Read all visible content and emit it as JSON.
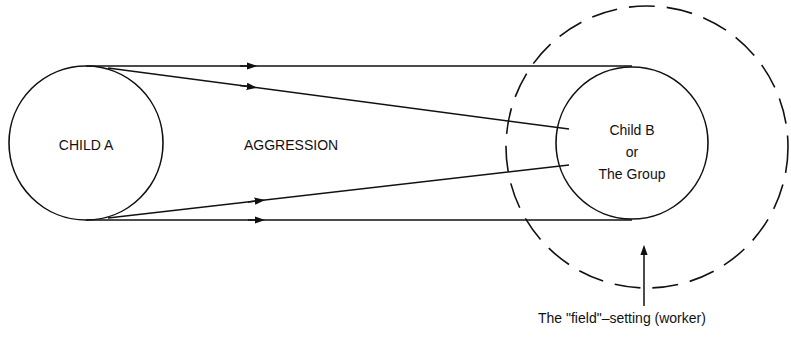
{
  "diagram": {
    "title": "",
    "nodes": {
      "child_a": {
        "label": "CHILD A"
      },
      "child_b": {
        "line1": "Child B",
        "line2": "or",
        "line3": "The Group"
      }
    },
    "relation": {
      "label": "AGGRESSION"
    },
    "field": {
      "label": "The \"field\"–setting (worker)"
    },
    "colors": {
      "stroke": "#111111",
      "background": "#ffffff"
    }
  }
}
